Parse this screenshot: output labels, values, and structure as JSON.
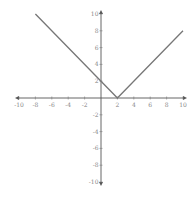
{
  "chart_data": {
    "type": "line",
    "title": "",
    "function": "y = |x - 2|",
    "xlabel": "",
    "ylabel": "",
    "xlim": [
      -10,
      10
    ],
    "ylim": [
      -10,
      10
    ],
    "grid": false,
    "x_ticks": [
      -10,
      -8,
      -6,
      -4,
      -2,
      2,
      4,
      6,
      8,
      10
    ],
    "y_ticks": [
      10,
      8,
      6,
      4,
      2,
      -2,
      -4,
      -6,
      -8,
      -10
    ],
    "series": [
      {
        "name": "y = |x - 2|",
        "x": [
          -8,
          2,
          10
        ],
        "y": [
          10,
          0,
          8
        ],
        "color": "#777777"
      }
    ]
  },
  "colors": {
    "axis": "#555555",
    "curve": "#777777",
    "labels": "#888888"
  }
}
